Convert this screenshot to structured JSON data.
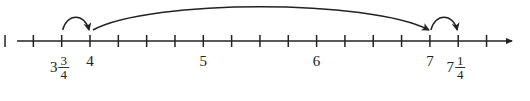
{
  "diagram": {
    "type": "number-line",
    "axis": {
      "y": 41,
      "x_start": 17,
      "x_end": 515,
      "color": "#222222",
      "arrow": "right"
    },
    "scale": {
      "unit_px": 113.3,
      "origin_value": 4,
      "origin_x": 90,
      "tick_step": 0.25
    },
    "ticks": [
      3.25,
      3.5,
      3.75,
      4,
      4.25,
      4.5,
      4.75,
      5,
      5.25,
      5.5,
      5.75,
      6,
      6.25,
      6.5,
      6.75,
      7,
      7.25,
      7.5
    ],
    "labels": [
      {
        "value": 3.75,
        "whole": "3",
        "num": "3",
        "den": "4",
        "text": "3 3/4"
      },
      {
        "value": 4,
        "whole": "4",
        "text": "4"
      },
      {
        "value": 5,
        "whole": "5",
        "text": "5"
      },
      {
        "value": 6,
        "whole": "6",
        "text": "6"
      },
      {
        "value": 7,
        "whole": "7",
        "text": "7"
      },
      {
        "value": 7.25,
        "whole": "7",
        "num": "1",
        "den": "4",
        "text": "7 1/4"
      }
    ],
    "jumps": [
      {
        "from": 3.75,
        "to": 4,
        "size": "1/4",
        "height": 16
      },
      {
        "from": 4,
        "to": 7,
        "size": "3",
        "height": 36
      },
      {
        "from": 7,
        "to": 7.25,
        "size": "1/4",
        "height": 16
      }
    ]
  }
}
